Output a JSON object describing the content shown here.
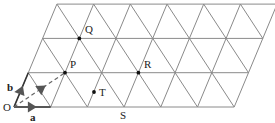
{
  "diagram": {
    "grid": {
      "rows": 3,
      "cols": 6,
      "origin_px": [
        14,
        107
      ],
      "unit_px": 36.7,
      "row_height_px": 34.3,
      "row_shift_px": 14.3,
      "line_color": "#8a8a8a"
    },
    "labels": {
      "O": "O",
      "a": "a",
      "b": "b",
      "P": "P",
      "Q": "Q",
      "R": "R",
      "S": "S",
      "T": "T"
    },
    "points": [
      {
        "name": "P",
        "lattice": [
          1,
          1
        ]
      },
      {
        "name": "Q",
        "lattice": [
          1,
          2
        ]
      },
      {
        "name": "R",
        "lattice": [
          3,
          1
        ]
      },
      {
        "name": "T",
        "note": "interior point"
      }
    ],
    "vectors": [
      {
        "name": "a",
        "from": "O",
        "direction": "along bottom edge"
      },
      {
        "name": "b",
        "from": "O",
        "direction": "along left edge"
      },
      {
        "name": "OP",
        "style": "dashed"
      }
    ],
    "arrow_color": "#555555"
  }
}
